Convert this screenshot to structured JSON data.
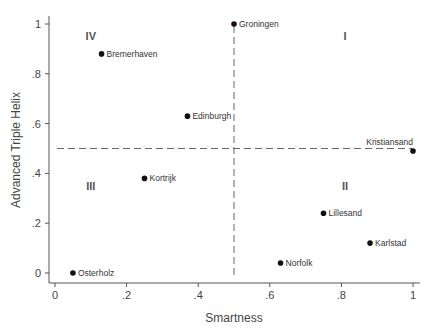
{
  "chart_data": {
    "type": "scatter",
    "title": "",
    "xlabel": "Smartness",
    "ylabel": "Advanced Triple Helix",
    "xlim": [
      0,
      1
    ],
    "ylim": [
      0,
      1
    ],
    "xticks": [
      "0",
      ".2",
      ".4",
      ".6",
      ".8",
      "1"
    ],
    "yticks": [
      "0",
      ".2",
      ".4",
      ".6",
      ".8",
      "1"
    ],
    "points": [
      {
        "label": "Groningen",
        "x": 0.5,
        "y": 1.0
      },
      {
        "label": "Bremerhaven",
        "x": 0.13,
        "y": 0.88
      },
      {
        "label": "Edinburgh",
        "x": 0.37,
        "y": 0.63
      },
      {
        "label": "Kristiansand",
        "x": 1.0,
        "y": 0.49
      },
      {
        "label": "Kortrijk",
        "x": 0.25,
        "y": 0.38
      },
      {
        "label": "Lillesand",
        "x": 0.75,
        "y": 0.24
      },
      {
        "label": "Karlstad",
        "x": 0.88,
        "y": 0.12
      },
      {
        "label": "Norfolk",
        "x": 0.63,
        "y": 0.04
      },
      {
        "label": "Osterholz",
        "x": 0.05,
        "y": 0.0
      }
    ],
    "reference_lines": {
      "vertical_x": 0.5,
      "horizontal_y": 0.5
    },
    "quadrant_labels": [
      {
        "label": "I",
        "x": 0.81,
        "y": 0.95
      },
      {
        "label": "II",
        "x": 0.81,
        "y": 0.35
      },
      {
        "label": "III",
        "x": 0.1,
        "y": 0.35
      },
      {
        "label": "IV",
        "x": 0.1,
        "y": 0.95
      }
    ],
    "grid": false,
    "legend": null
  }
}
